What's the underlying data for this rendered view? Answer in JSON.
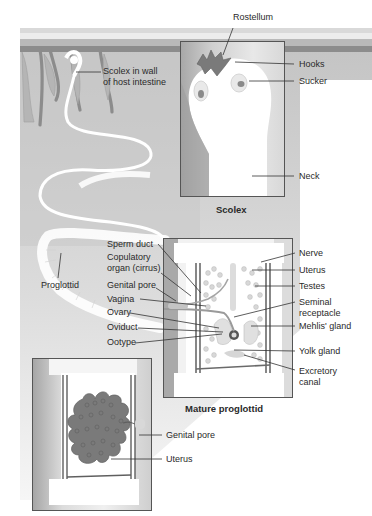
{
  "figure": {
    "colors": {
      "intestine_bg": "#c8c8c8",
      "intestine_wall": "#8a8a8a",
      "villi": "#b4b4b4",
      "worm": "#ffffff",
      "hooks": "#7d7d7d",
      "uterus_mass": "#7a7a7a",
      "leader_line": "#333333"
    }
  },
  "intestine": {
    "labels": {
      "scolex_in_wall": [
        "Scolex in wall",
        "of host intestine"
      ],
      "proglottid": "Proglottid"
    }
  },
  "scolex_panel": {
    "caption": "Scolex",
    "labels": {
      "rostellum": "Rostellum",
      "hooks": "Hooks",
      "sucker": "Sucker",
      "neck": "Neck"
    }
  },
  "mature_proglottid_panel": {
    "caption": "Mature proglottid",
    "left_labels": [
      "Sperm duct",
      [
        "Copulatory",
        "organ (cirrus)"
      ],
      "Genital pore",
      "Vagina",
      "Ovary",
      "Oviduct",
      "Ootype"
    ],
    "right_labels": [
      "Nerve",
      "Uterus",
      "Testes",
      [
        "Seminal",
        "receptacle"
      ],
      "Mehlis' gland",
      "Yolk gland",
      [
        "Excretory",
        "canal"
      ]
    ]
  },
  "gravid_proglottid_panel": {
    "labels": {
      "genital_pore": "Genital pore",
      "uterus": "Uterus"
    }
  }
}
